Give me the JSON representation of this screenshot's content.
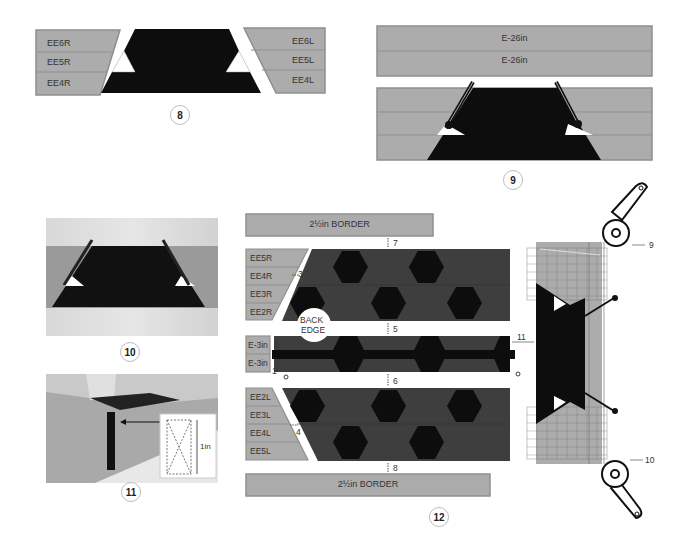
{
  "colors": {
    "fabric_grey": "#acacac",
    "fabric_grey_border": "#8f8f8f",
    "fabric_dark": "#3e3e3e",
    "fabric_black": "#0d0d0d",
    "badge_border": "#bdbdbd",
    "white": "#ffffff"
  },
  "step8": {
    "badge": "8",
    "left_strips": [
      "EE6R",
      "EE5R",
      "EE4R"
    ],
    "right_strips": [
      "EE6L",
      "EE5L",
      "EE4L"
    ]
  },
  "step9": {
    "badge": "9",
    "top_strips": [
      "E-26in",
      "E-26in"
    ]
  },
  "step10": {
    "badge": "10"
  },
  "step11": {
    "badge": "11",
    "inset_dimension": "1in"
  },
  "step12": {
    "badge": "12",
    "top_border": "2½in BORDER",
    "bottom_border": "2½in BORDER",
    "upper_strips": [
      "EE5R",
      "EE4R",
      "EE3R",
      "EE2R"
    ],
    "middle_strips": [
      "E-3in",
      "E-3in"
    ],
    "lower_strips": [
      "EE2L",
      "EE3L",
      "EE4L",
      "EE5L"
    ],
    "back_edge_label": [
      "BACK",
      "EDGE"
    ],
    "dimension_markers": {
      "m1": "1",
      "m2": "2",
      "m3": "3",
      "m4": "4",
      "m5": "5",
      "m6": "6",
      "m7": "7",
      "m8": "8",
      "m9": "9",
      "m10": "10",
      "m11": "11"
    }
  }
}
